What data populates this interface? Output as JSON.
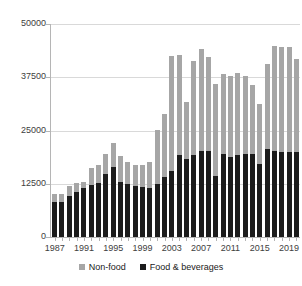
{
  "chart_data": {
    "type": "bar",
    "subtype": "stacked-vertical",
    "title": "",
    "xlabel": "",
    "ylabel": "",
    "ylim": [
      0,
      50000
    ],
    "yticks": [
      0,
      12500,
      25000,
      37500,
      50000
    ],
    "ytick_labels": [
      "0",
      "12500",
      "25000",
      "37500",
      "50000"
    ],
    "grid": true,
    "grid_axis": "y",
    "legend_position": "bottom",
    "categories": [
      "1987",
      "1988",
      "1989",
      "1990",
      "1991",
      "1992",
      "1993",
      "1994",
      "1995",
      "1996",
      "1997",
      "1998",
      "1999",
      "2000",
      "2001",
      "2002",
      "2003",
      "2004",
      "2005",
      "2006",
      "2007",
      "2008",
      "2009",
      "2010",
      "2011",
      "2012",
      "2013",
      "2014",
      "2015",
      "2016",
      "2017",
      "2018",
      "2019",
      "2020"
    ],
    "xtick_labels": [
      "1987",
      "1991",
      "1995",
      "1999",
      "2003",
      "2007",
      "2011",
      "2015",
      "2019"
    ],
    "series": [
      {
        "name": "Food & beverages",
        "color": "#1c1c1c",
        "values": [
          8200,
          8300,
          9600,
          10600,
          11600,
          12200,
          12600,
          14700,
          16400,
          12900,
          12400,
          11900,
          11800,
          11600,
          12400,
          14000,
          15500,
          19200,
          18200,
          19300,
          20100,
          20100,
          14300,
          19400,
          18900,
          19300,
          19400,
          19400,
          17100,
          20600,
          20200,
          20000,
          19900,
          20000
        ]
      },
      {
        "name": "Non-food",
        "color": "#a6a6a6",
        "values": [
          1800,
          1900,
          2400,
          2000,
          1400,
          4100,
          4400,
          4700,
          5600,
          6200,
          5100,
          5000,
          5000,
          6100,
          12800,
          14800,
          27000,
          23500,
          13500,
          22000,
          24000,
          22100,
          21600,
          18800,
          19000,
          19200,
          18500,
          16200,
          14100,
          19900,
          24700,
          24700,
          24800,
          21800
        ]
      }
    ],
    "totals": [
      10000,
      10200,
      12000,
      12600,
      13000,
      16300,
      17000,
      19400,
      22000,
      19100,
      17500,
      16900,
      16800,
      17700,
      25200,
      28800,
      42500,
      42700,
      31700,
      41300,
      44100,
      42200,
      35900,
      38200,
      37900,
      38500,
      37900,
      35600,
      31200,
      40500,
      44900,
      44700,
      44700,
      41800
    ]
  },
  "legend": {
    "items": [
      {
        "label": "Non-food",
        "color": "#a6a6a6"
      },
      {
        "label": "Food & beverages",
        "color": "#1c1c1c"
      }
    ]
  }
}
